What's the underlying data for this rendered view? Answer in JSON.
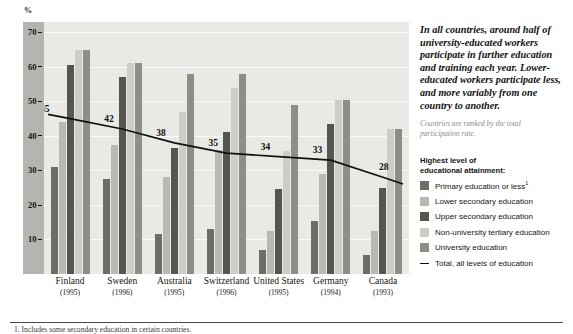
{
  "axis": {
    "unit_label": "%",
    "y_ticks": [
      70,
      60,
      50,
      40,
      30,
      20,
      10
    ],
    "y_min": 0,
    "y_max": 73
  },
  "callout": {
    "headline": "In all countries, around half of university-educated workers participate in further education and training each year. Lower-educated workers participate less, and more variably from one country to another.",
    "subnote": "Countries are ranked by the total participation rate."
  },
  "legend": {
    "title_line1": "Highest level of",
    "title_line2": "educational attainment:",
    "items": [
      {
        "label": "Primary education or less",
        "sup": "1",
        "color": "#6e6e68",
        "kind": "swatch",
        "icon": "square-swatch"
      },
      {
        "label": "Lower secondary education",
        "sup": "",
        "color": "#b9b9b3",
        "kind": "swatch",
        "icon": "square-swatch"
      },
      {
        "label": "Upper secondary education",
        "sup": "",
        "color": "#56564f",
        "kind": "swatch",
        "icon": "square-swatch"
      },
      {
        "label": "Non-university tertiary education",
        "sup": "",
        "color": "#cdcdc7",
        "kind": "swatch",
        "icon": "square-swatch"
      },
      {
        "label": "University education",
        "sup": "",
        "color": "#8e8e86",
        "kind": "swatch",
        "icon": "square-swatch"
      },
      {
        "label": "Total, all levels of education",
        "sup": "",
        "color": "#111111",
        "kind": "line",
        "icon": "line-swatch"
      }
    ]
  },
  "footnote": "1. Includes some secondary education in certain countries.",
  "chart_data": {
    "type": "bar",
    "title": "",
    "subtitle": "",
    "xlabel": "",
    "ylabel": "%",
    "ylim": [
      0,
      73
    ],
    "grid": true,
    "legend_position": "right",
    "categories": [
      "Finland",
      "Sweden",
      "Australia",
      "Switzerland",
      "United States",
      "Germany",
      "Canada"
    ],
    "category_years": [
      "(1995)",
      "(1996)",
      "(1995)",
      "(1996)",
      "(1995)",
      "(1994)",
      "(1993)"
    ],
    "series": [
      {
        "name": "Primary education or less",
        "color": "#6e6e68",
        "values": [
          31,
          27.5,
          11.5,
          13,
          7,
          15.5,
          5.5
        ]
      },
      {
        "name": "Lower secondary education",
        "color": "#b9b9b3",
        "values": [
          44,
          37.5,
          28,
          36,
          12.5,
          29,
          12.5
        ]
      },
      {
        "name": "Upper secondary education",
        "color": "#56564f",
        "values": [
          60.5,
          57,
          36.5,
          41,
          24.5,
          43.5,
          25
        ]
      },
      {
        "name": "Non-university tertiary education",
        "color": "#cdcdc7",
        "values": [
          65,
          61,
          47,
          54,
          35.5,
          50.5,
          42
        ]
      },
      {
        "name": "University education",
        "color": "#8e8e86",
        "values": [
          65,
          61,
          58,
          58,
          49,
          50.5,
          42
        ]
      }
    ],
    "trend": {
      "name": "Total, all levels of education",
      "color": "#111111",
      "values": [
        45,
        42,
        38,
        35,
        34,
        33,
        28
      ],
      "labels": [
        "45",
        "42",
        "38",
        "35",
        "34",
        "33",
        "28"
      ]
    }
  }
}
